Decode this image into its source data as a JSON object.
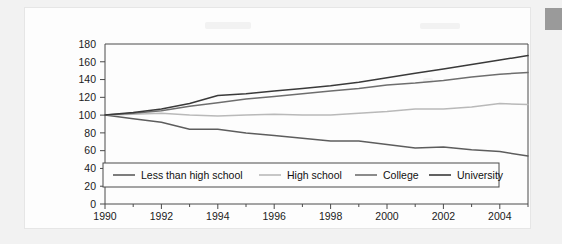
{
  "page": {
    "background_color": "#f2f2f2",
    "card_background_color": "#fdfdfd",
    "corner_block_color": "#9a9a9a"
  },
  "chart_data": {
    "type": "line",
    "title": "",
    "subtitle": "",
    "xlabel": "",
    "ylabel": "",
    "xlim": [
      1990,
      2005
    ],
    "ylim": [
      0,
      180
    ],
    "y_ticks": [
      0,
      20,
      40,
      60,
      80,
      100,
      120,
      140,
      160,
      180
    ],
    "y_tick_labels": [
      "0",
      "20",
      "40",
      "60",
      "80",
      "100",
      "120",
      "140",
      "160",
      "180"
    ],
    "x_ticks": [
      1990,
      1992,
      1994,
      1996,
      1998,
      2000,
      2002,
      2004
    ],
    "x_tick_labels": [
      "1990",
      "1992",
      "1994",
      "1996",
      "1998",
      "2000",
      "2002",
      "2004"
    ],
    "x_minor_ticks": [
      1991,
      1993,
      1995,
      1997,
      1999,
      2001,
      2003,
      2005
    ],
    "grid": false,
    "legend_position": "inside-bottom",
    "x": [
      1990,
      1991,
      1992,
      1993,
      1994,
      1995,
      1996,
      1997,
      1998,
      1999,
      2000,
      2001,
      2002,
      2003,
      2004,
      2005
    ],
    "series": [
      {
        "name": "Less than high school",
        "color": "#5d5d5d",
        "values": [
          100,
          96,
          92,
          84,
          84,
          80,
          77,
          74,
          71,
          71,
          67,
          63,
          64,
          61,
          59,
          54
        ]
      },
      {
        "name": "High school",
        "color": "#b9b9b9",
        "values": [
          100,
          101,
          102,
          100,
          99,
          100,
          101,
          100,
          100,
          102,
          104,
          107,
          107,
          109,
          113,
          112
        ]
      },
      {
        "name": "College",
        "color": "#6e6e6e",
        "values": [
          100,
          102,
          105,
          110,
          114,
          118,
          121,
          124,
          127,
          130,
          134,
          136,
          139,
          143,
          146,
          148
        ]
      },
      {
        "name": "University",
        "color": "#3a3a3a",
        "values": [
          100,
          103,
          107,
          113,
          122,
          124,
          127,
          130,
          133,
          137,
          142,
          147,
          152,
          157,
          162,
          167
        ]
      }
    ]
  },
  "legend": {
    "items": [
      {
        "label": "Less than high school",
        "color": "#5d5d5d"
      },
      {
        "label": "High school",
        "color": "#b9b9b9"
      },
      {
        "label": "College",
        "color": "#6e6e6e"
      },
      {
        "label": "University",
        "color": "#3a3a3a"
      }
    ]
  }
}
